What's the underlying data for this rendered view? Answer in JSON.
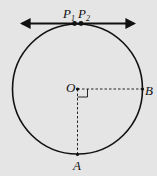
{
  "diagram": {
    "type": "geometry",
    "background": "#e5e5e5",
    "stroke_color": "#111111",
    "circle": {
      "center_label": "O",
      "cx": 77.5,
      "cy": 89,
      "r": 65
    },
    "tangent_line": {
      "y": 23,
      "x1": 20,
      "x2": 136,
      "arrows": "both"
    },
    "points": [
      {
        "id": "P1",
        "label": "P",
        "subscript": "1",
        "x": 74,
        "y": 23
      },
      {
        "id": "P2",
        "label": "P",
        "subscript": "2",
        "x": 81,
        "y": 23
      },
      {
        "id": "O",
        "label": "O",
        "x": 77.5,
        "y": 89
      },
      {
        "id": "B",
        "label": "B",
        "x": 142.5,
        "y": 89
      },
      {
        "id": "A",
        "label": "A",
        "x": 77.5,
        "y": 154
      }
    ],
    "segments": [
      {
        "from": "O",
        "to": "B",
        "style": "dashed"
      },
      {
        "from": "O",
        "to": "A",
        "style": "dashed"
      }
    ],
    "right_angle_marker": {
      "at": "O",
      "between": [
        "OB",
        "OA"
      ]
    },
    "labels": {
      "P1_main": "P",
      "P1_sub": "1",
      "P2_main": "P",
      "P2_sub": "2",
      "O": "O",
      "B": "B",
      "A": "A"
    }
  }
}
